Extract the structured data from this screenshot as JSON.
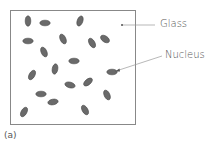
{
  "figure": {
    "caption": "(a)",
    "labels": {
      "glass": "Glass",
      "nucleus": "Nucleus"
    },
    "colors": {
      "box_stroke": "#888888",
      "nucleus_fill": "#6a6a6a",
      "nucleus_stroke": "#4a4a4a",
      "leader_line": "#999999",
      "text": "#555555"
    },
    "box": {
      "x": 10.5,
      "y": 10.5,
      "w": 125,
      "h": 114
    },
    "nuclei": [
      {
        "cx": 28,
        "cy": 21,
        "rx": 2.8,
        "ry": 5.2,
        "rot": 0
      },
      {
        "cx": 45,
        "cy": 23,
        "rx": 5.2,
        "ry": 2.8,
        "rot": 0
      },
      {
        "cx": 80,
        "cy": 21,
        "rx": 2.8,
        "ry": 5.2,
        "rot": 20
      },
      {
        "cx": 28,
        "cy": 41,
        "rx": 5.2,
        "ry": 2.8,
        "rot": 0
      },
      {
        "cx": 63,
        "cy": 39,
        "rx": 2.8,
        "ry": 5.2,
        "rot": -25
      },
      {
        "cx": 92,
        "cy": 43,
        "rx": 2.8,
        "ry": 5.2,
        "rot": -30
      },
      {
        "cx": 105,
        "cy": 39,
        "rx": 5.0,
        "ry": 3.0,
        "rot": 35
      },
      {
        "cx": 44,
        "cy": 52,
        "rx": 2.8,
        "ry": 5.2,
        "rot": -25
      },
      {
        "cx": 74,
        "cy": 61,
        "rx": 5.2,
        "ry": 2.8,
        "rot": 0
      },
      {
        "cx": 55,
        "cy": 69,
        "rx": 2.8,
        "ry": 5.2,
        "rot": 10
      },
      {
        "cx": 32,
        "cy": 75,
        "rx": 2.8,
        "ry": 5.2,
        "rot": 30
      },
      {
        "cx": 112,
        "cy": 72,
        "rx": 5.2,
        "ry": 2.8,
        "rot": 0
      },
      {
        "cx": 70,
        "cy": 85,
        "rx": 5.2,
        "ry": 2.8,
        "rot": 15
      },
      {
        "cx": 88,
        "cy": 82,
        "rx": 2.8,
        "ry": 5.2,
        "rot": 50
      },
      {
        "cx": 41,
        "cy": 94,
        "rx": 5.2,
        "ry": 2.8,
        "rot": 0
      },
      {
        "cx": 107,
        "cy": 95,
        "rx": 2.8,
        "ry": 5.2,
        "rot": -25
      },
      {
        "cx": 53,
        "cy": 102,
        "rx": 5.2,
        "ry": 2.8,
        "rot": -10
      },
      {
        "cx": 24,
        "cy": 112,
        "rx": 2.8,
        "ry": 5.2,
        "rot": 30
      },
      {
        "cx": 85,
        "cy": 110,
        "rx": 2.8,
        "ry": 5.2,
        "rot": -30
      }
    ]
  }
}
